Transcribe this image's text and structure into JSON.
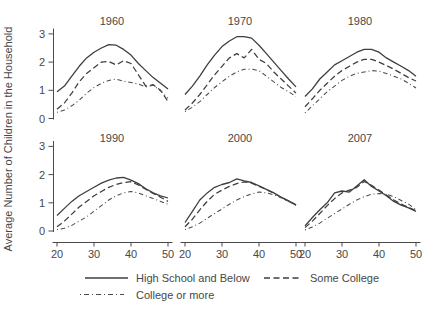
{
  "chart_data": {
    "type": "line",
    "ylabel": "Average Number of Children in the Household",
    "xlim": [
      20,
      50
    ],
    "ylim": [
      0,
      3
    ],
    "grid": false,
    "legend_position": "bottom",
    "x": [
      20,
      22,
      24,
      26,
      28,
      30,
      32,
      34,
      36,
      38,
      40,
      42,
      44,
      46,
      48,
      50
    ],
    "x_ticks": [
      "20",
      "30",
      "40",
      "50"
    ],
    "y_ticks": [
      "0",
      "1",
      "2",
      "3"
    ],
    "legend": {
      "hs": {
        "label": "High School and Below",
        "style": "solid"
      },
      "sc": {
        "label": "Some College",
        "style": "dashed"
      },
      "cm": {
        "label": "College or more",
        "style": "dash-dot"
      }
    },
    "panels": [
      {
        "title": "1960",
        "series": {
          "hs": [
            0.95,
            1.15,
            1.5,
            1.85,
            2.15,
            2.35,
            2.5,
            2.62,
            2.6,
            2.45,
            2.25,
            1.95,
            1.7,
            1.45,
            1.25,
            1.05
          ],
          "sc": [
            0.33,
            0.55,
            0.9,
            1.3,
            1.6,
            1.8,
            2.0,
            2.02,
            1.9,
            2.05,
            1.95,
            1.55,
            1.15,
            1.2,
            1.0,
            0.6
          ],
          "cm": [
            0.22,
            0.3,
            0.45,
            0.65,
            0.9,
            1.1,
            1.25,
            1.35,
            1.4,
            1.32,
            1.28,
            1.22,
            1.12,
            1.18,
            0.98,
            0.72
          ]
        }
      },
      {
        "title": "1970",
        "series": {
          "hs": [
            0.85,
            1.15,
            1.5,
            1.9,
            2.25,
            2.55,
            2.75,
            2.9,
            2.9,
            2.85,
            2.6,
            2.3,
            2.0,
            1.7,
            1.4,
            1.12
          ],
          "sc": [
            0.3,
            0.55,
            0.85,
            1.2,
            1.55,
            1.85,
            2.15,
            2.3,
            2.15,
            2.45,
            2.1,
            1.95,
            1.65,
            1.4,
            1.15,
            0.9
          ],
          "cm": [
            0.25,
            0.4,
            0.6,
            0.85,
            1.1,
            1.3,
            1.5,
            1.65,
            1.75,
            1.75,
            1.7,
            1.5,
            1.3,
            1.1,
            0.95,
            0.78
          ]
        }
      },
      {
        "title": "1980",
        "series": {
          "hs": [
            0.78,
            1.05,
            1.4,
            1.65,
            1.9,
            2.05,
            2.2,
            2.35,
            2.45,
            2.45,
            2.35,
            2.15,
            2.0,
            1.85,
            1.7,
            1.5
          ],
          "sc": [
            0.42,
            0.7,
            1.0,
            1.25,
            1.5,
            1.7,
            1.85,
            2.0,
            2.1,
            2.1,
            2.0,
            1.88,
            1.75,
            1.6,
            1.45,
            1.33
          ],
          "cm": [
            0.2,
            0.45,
            0.7,
            0.95,
            1.15,
            1.35,
            1.5,
            1.6,
            1.65,
            1.7,
            1.68,
            1.6,
            1.5,
            1.4,
            1.25,
            1.08
          ]
        }
      },
      {
        "title": "1990",
        "series": {
          "hs": [
            0.55,
            0.8,
            1.05,
            1.25,
            1.4,
            1.55,
            1.7,
            1.8,
            1.88,
            1.9,
            1.8,
            1.68,
            1.5,
            1.35,
            1.25,
            1.17
          ],
          "sc": [
            0.15,
            0.35,
            0.6,
            0.85,
            1.05,
            1.25,
            1.4,
            1.55,
            1.65,
            1.72,
            1.75,
            1.63,
            1.48,
            1.33,
            1.2,
            1.05
          ],
          "cm": [
            0.05,
            0.1,
            0.2,
            0.35,
            0.5,
            0.7,
            0.9,
            1.1,
            1.25,
            1.35,
            1.4,
            1.35,
            1.25,
            1.15,
            1.05,
            0.95
          ]
        }
      },
      {
        "title": "2000",
        "series": {
          "hs": [
            0.3,
            0.7,
            1.1,
            1.35,
            1.55,
            1.65,
            1.72,
            1.85,
            1.78,
            1.72,
            1.6,
            1.48,
            1.35,
            1.2,
            1.07,
            0.93
          ],
          "sc": [
            0.15,
            0.42,
            0.75,
            1.05,
            1.3,
            1.45,
            1.58,
            1.68,
            1.74,
            1.7,
            1.58,
            1.47,
            1.34,
            1.19,
            1.06,
            0.92
          ],
          "cm": [
            0.05,
            0.15,
            0.28,
            0.45,
            0.62,
            0.78,
            0.95,
            1.1,
            1.22,
            1.32,
            1.38,
            1.35,
            1.28,
            1.18,
            1.05,
            0.92
          ]
        }
      },
      {
        "title": "2007",
        "series": {
          "hs": [
            0.18,
            0.48,
            0.75,
            1.0,
            1.35,
            1.42,
            1.38,
            1.6,
            1.82,
            1.58,
            1.42,
            1.25,
            1.05,
            0.92,
            0.82,
            0.7
          ],
          "sc": [
            0.12,
            0.35,
            0.62,
            0.9,
            1.15,
            1.35,
            1.45,
            1.55,
            1.76,
            1.62,
            1.45,
            1.28,
            1.1,
            0.95,
            0.84,
            0.72
          ],
          "cm": [
            0.04,
            0.14,
            0.28,
            0.45,
            0.62,
            0.78,
            0.95,
            1.1,
            1.22,
            1.3,
            1.33,
            1.3,
            1.22,
            1.08,
            0.95,
            0.76
          ]
        }
      }
    ],
    "colors": {
      "line": "#3e3e3e",
      "text": "#474747"
    }
  }
}
